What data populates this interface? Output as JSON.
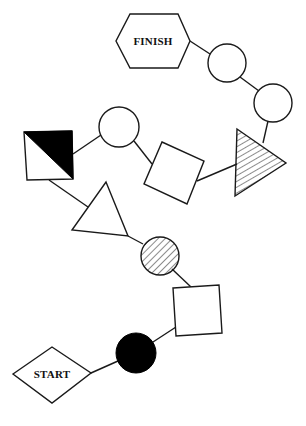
{
  "diagram": {
    "title": "",
    "colors": {
      "stroke": "#1a1a1a",
      "fill_white": "#ffffff",
      "fill_black": "#000000",
      "background": "#ffffff"
    },
    "nodes": [
      {
        "id": "start",
        "shape": "diamond",
        "label": "START",
        "fill": "white"
      },
      {
        "id": "black-circle",
        "shape": "circle",
        "label": "",
        "fill": "black"
      },
      {
        "id": "square-lower",
        "shape": "square",
        "label": "",
        "fill": "white"
      },
      {
        "id": "hatched-circle",
        "shape": "circle",
        "label": "",
        "fill": "hatched"
      },
      {
        "id": "triangle-white",
        "shape": "triangle",
        "label": "",
        "fill": "white"
      },
      {
        "id": "half-black-square",
        "shape": "square",
        "label": "",
        "fill": "half-black"
      },
      {
        "id": "circle-left",
        "shape": "circle",
        "label": "",
        "fill": "white"
      },
      {
        "id": "square-rotated",
        "shape": "square",
        "label": "",
        "fill": "white"
      },
      {
        "id": "hatched-triangle",
        "shape": "triangle",
        "label": "",
        "fill": "hatched"
      },
      {
        "id": "circle-right-lower",
        "shape": "circle",
        "label": "",
        "fill": "white"
      },
      {
        "id": "circle-right-upper",
        "shape": "circle",
        "label": "",
        "fill": "white"
      },
      {
        "id": "finish",
        "shape": "hexagon",
        "label": "FINISH",
        "fill": "white"
      }
    ],
    "edges": [
      [
        "start",
        "black-circle"
      ],
      [
        "black-circle",
        "square-lower"
      ],
      [
        "square-lower",
        "hatched-circle"
      ],
      [
        "hatched-circle",
        "triangle-white"
      ],
      [
        "triangle-white",
        "half-black-square"
      ],
      [
        "half-black-square",
        "circle-left"
      ],
      [
        "circle-left",
        "square-rotated"
      ],
      [
        "square-rotated",
        "hatched-triangle"
      ],
      [
        "hatched-triangle",
        "circle-right-lower"
      ],
      [
        "circle-right-lower",
        "circle-right-upper"
      ],
      [
        "circle-right-upper",
        "finish"
      ]
    ],
    "labels": {
      "start": "START",
      "finish": "FINISH"
    }
  }
}
